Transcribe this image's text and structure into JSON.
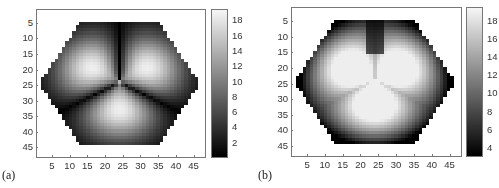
{
  "chart_data": [
    {
      "type": "heatmap",
      "panel_label": "(a)",
      "title": "",
      "xlabel": "",
      "ylabel": "",
      "x_ticks": [
        5,
        10,
        15,
        20,
        25,
        30,
        35,
        40,
        45
      ],
      "y_ticks": [
        5,
        10,
        15,
        20,
        25,
        30,
        35,
        40,
        45
      ],
      "xlim": [
        0.5,
        48.5
      ],
      "ylim": [
        0.5,
        48.5
      ],
      "grid_size": [
        48,
        48
      ],
      "colormap": "gray",
      "colorbar": {
        "ticks": [
          2,
          4,
          6,
          8,
          10,
          12,
          14,
          16,
          18
        ],
        "range": [
          0,
          19.5
        ]
      },
      "description": "Hexagonal domain; three bright lobes (petals) radiating from the center near (24,24) at angles up-left, up-right, and down; dark background elsewhere inside the hexagon",
      "pattern": "petals",
      "petal_angles_deg": [
        150,
        30,
        270
      ],
      "center": [
        24,
        24
      ],
      "value_min": 0,
      "value_max": 19
    },
    {
      "type": "heatmap",
      "panel_label": "(b)",
      "title": "",
      "xlabel": "",
      "ylabel": "",
      "x_ticks": [
        5,
        10,
        15,
        20,
        25,
        30,
        35,
        40,
        45
      ],
      "y_ticks": [
        5,
        10,
        15,
        20,
        25,
        30,
        35,
        40,
        45
      ],
      "xlim": [
        0.5,
        48.5
      ],
      "ylim": [
        0.5,
        48.5
      ],
      "grid_size": [
        48,
        48
      ],
      "colormap": "gray",
      "colorbar": {
        "ticks": [
          4,
          6,
          8,
          10,
          12,
          14,
          16,
          18
        ],
        "range": [
          3,
          19.5
        ]
      },
      "description": "Hexagonal domain; large bright trefoil region in the center with dark corners near hexagon edges and a dark notch at top center",
      "pattern": "trefoil",
      "petal_angles_deg": [
        150,
        30,
        270
      ],
      "center": [
        24,
        24
      ],
      "value_min": 3,
      "value_max": 19
    }
  ],
  "panels": [
    {
      "label": "(a)"
    },
    {
      "label": "(b)"
    }
  ]
}
